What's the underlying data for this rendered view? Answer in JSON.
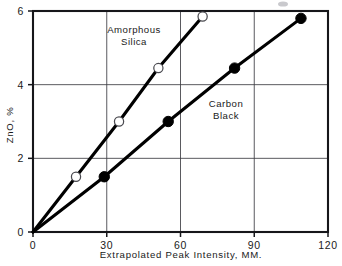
{
  "chart_data": {
    "type": "line",
    "title": "",
    "xlabel": "Extrapolated  Peak  Intensity, MM.",
    "ylabel": "ZnO, %",
    "xlim": [
      0,
      120
    ],
    "ylim": [
      0,
      6
    ],
    "xticks": [
      0,
      30,
      60,
      90,
      120
    ],
    "xtick_labels": [
      "0",
      "30",
      "60",
      "90",
      "120"
    ],
    "yticks": [
      0,
      2,
      4,
      6
    ],
    "ytick_labels": [
      "0",
      "2",
      "4",
      "6"
    ],
    "grid": "both-inner",
    "legend": "inline-annotations",
    "series": [
      {
        "name": "Amorphous Silica",
        "marker": "open-circle",
        "label_x": 42,
        "label_y": 5.35,
        "points": [
          {
            "x": 0,
            "y": 0
          },
          {
            "x": 17.5,
            "y": 1.5
          },
          {
            "x": 35,
            "y": 3.0
          },
          {
            "x": 51,
            "y": 4.45
          },
          {
            "x": 69,
            "y": 5.85
          }
        ]
      },
      {
        "name": "Carbon Black",
        "marker": "filled-circle",
        "label_x": 80,
        "label_y": 2.95,
        "points": [
          {
            "x": 0,
            "y": 0
          },
          {
            "x": 29,
            "y": 1.5
          },
          {
            "x": 55,
            "y": 3.0
          },
          {
            "x": 82,
            "y": 4.45
          },
          {
            "x": 109,
            "y": 5.8
          }
        ]
      }
    ]
  },
  "annotations": {
    "amorphous_line1": "Amorphous",
    "amorphous_line2": "Silica",
    "carbon_line1": "Carbon",
    "carbon_line2": "Black"
  }
}
